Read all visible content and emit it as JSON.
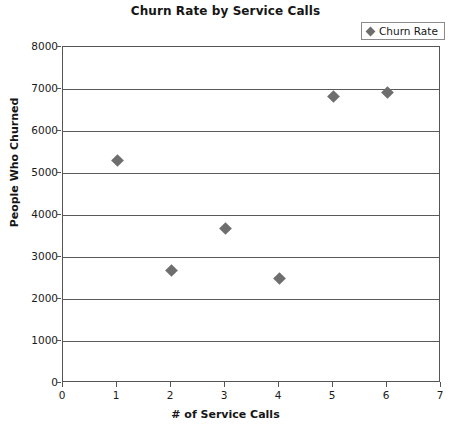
{
  "chart_data": {
    "type": "scatter",
    "title": "Churn Rate by Service Calls",
    "xlabel": "# of Service Calls",
    "ylabel": "People Who Churned",
    "xlim": [
      0,
      7
    ],
    "ylim": [
      0,
      8000
    ],
    "x_ticks": [
      0,
      1,
      2,
      3,
      4,
      5,
      6,
      7
    ],
    "y_ticks": [
      0,
      1000,
      2000,
      3000,
      4000,
      5000,
      6000,
      7000,
      8000
    ],
    "grid": "horizontal",
    "legend_position": "top-right",
    "marker": "diamond",
    "marker_color": "#6e6e6e",
    "series": [
      {
        "name": "Churn Rate",
        "x": [
          1,
          2,
          3,
          4,
          5,
          6
        ],
        "values": [
          5300,
          2670,
          3680,
          2500,
          6820,
          6920
        ],
        "points": [
          {
            "x": 1,
            "y": 5300
          },
          {
            "x": 2,
            "y": 2670
          },
          {
            "x": 3,
            "y": 3680
          },
          {
            "x": 4,
            "y": 2500
          },
          {
            "x": 5,
            "y": 6820
          },
          {
            "x": 6,
            "y": 6920
          }
        ]
      }
    ]
  },
  "legend": {
    "entries": [
      {
        "label": "Churn Rate",
        "marker_icon": "diamond-marker-icon",
        "color": "#6e6e6e"
      }
    ]
  },
  "colors": {
    "marker": "#6e6e6e",
    "axis": "#555555",
    "gridline": "#5a5a5a",
    "text": "#1a1a1a",
    "background": "#ffffff"
  }
}
